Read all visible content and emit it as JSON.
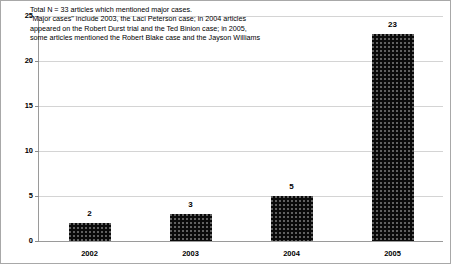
{
  "chart_data": {
    "type": "bar",
    "title": "",
    "subtitle": "",
    "xlabel": "",
    "ylabel": "",
    "categories": [
      "2002",
      "2003",
      "2004",
      "2005"
    ],
    "values": [
      2,
      3,
      5,
      23
    ],
    "series": [
      {
        "name": "Articles mentioning major cases",
        "values": [
          2,
          3,
          5,
          23
        ]
      }
    ],
    "ylim": [
      0,
      25
    ],
    "ytick_values": [
      0,
      5,
      10,
      15,
      20,
      25
    ],
    "ytick_labels": [
      "0",
      "5",
      "10",
      "15",
      "20",
      "25"
    ],
    "grid": "horizontal",
    "legend": "none",
    "bar_color": "#0a0a0a",
    "bar_pattern": "fine-white-dot-texture",
    "gridline_color": "#d4d4d4",
    "axis_color": "#9a9a9a",
    "frame_color": "#a8a8a8",
    "data_labels": [
      "2",
      "3",
      "5",
      "23"
    ],
    "annotation": {
      "position": "top-left-inside-plot",
      "lines": [
        "Total N = 33 articles which mentioned major cases.",
        "\"Major cases\" include 2003, the Laci Peterson case; in 2004 articles",
        "appeared on the Robert Durst trial and the Ted Binion case; in 2005,",
        "some articles mentioned the Robert Blake case and the Jayson Williams"
      ]
    }
  }
}
